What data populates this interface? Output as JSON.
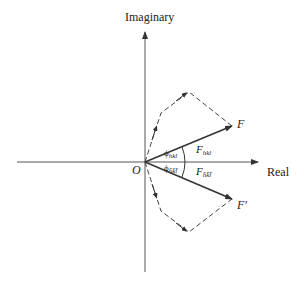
{
  "diagram": {
    "axes": {
      "vertical_label": "Imaginary",
      "horizontal_label": "Real",
      "origin_label": "O"
    },
    "vectors": [
      {
        "label": "F",
        "magnitude_label": "F",
        "magnitude_sub": "hkl",
        "phase_label": "ϕ",
        "phase_sub": "hkl"
      },
      {
        "label": "F'",
        "magnitude_label": "F",
        "magnitude_sub": "h̄k̄l̄",
        "phase_label": "ϕ",
        "phase_sub": "h̄k̄l̄"
      }
    ],
    "colors": {
      "line": "#333333",
      "background": "#ffffff"
    }
  }
}
